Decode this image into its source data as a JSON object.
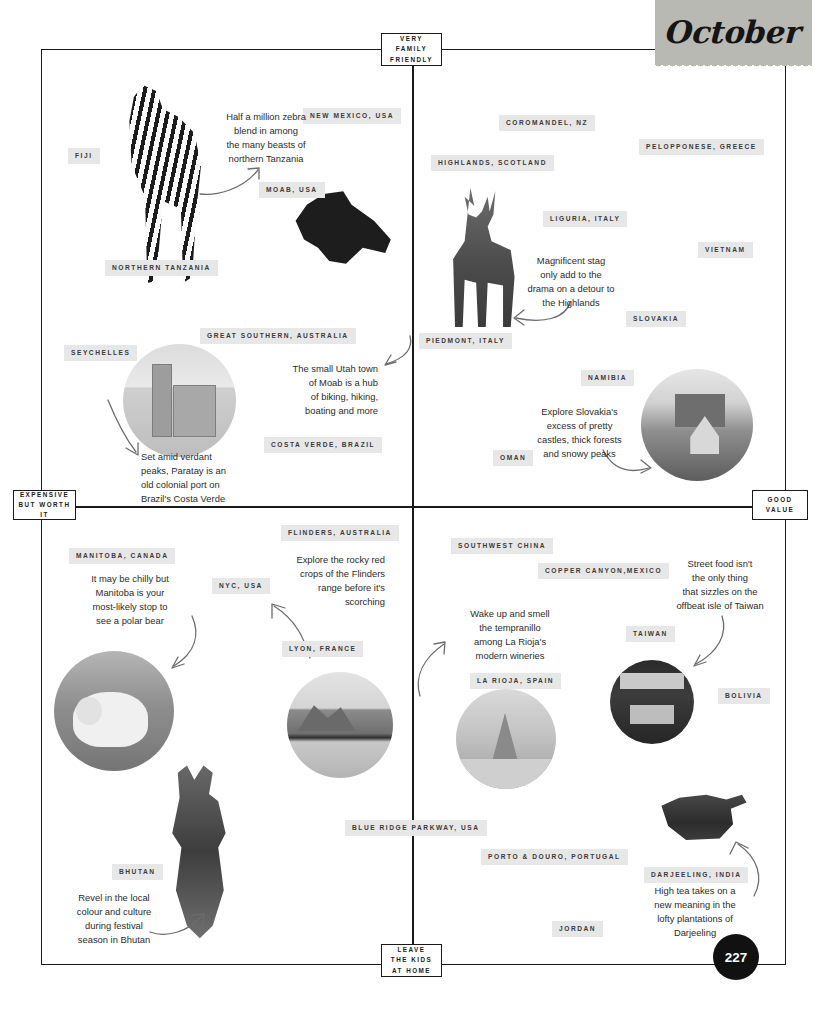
{
  "page": {
    "month": "October",
    "page_number": "227",
    "background_color": "#ffffff",
    "pill_color": "#e7e7e7",
    "tag_color": "#b9b9b4",
    "ink_color": "#1a1a1a"
  },
  "axes": {
    "top": "VERY\nFAMILY\nFRIENDLY",
    "bottom": "LEAVE\nTHE KIDS\nAT HOME",
    "left": "EXPENSIVE\nBUT WORTH IT",
    "right": "GOOD\nVALUE",
    "top_lines": [
      "VERY",
      "FAMILY",
      "FRIENDLY"
    ],
    "bottom_lines": [
      "LEAVE",
      "THE KIDS",
      "AT HOME"
    ],
    "left_lines": [
      "EXPENSIVE",
      "BUT WORTH IT"
    ],
    "right_lines": [
      "GOOD",
      "VALUE"
    ]
  },
  "destinations": [
    {
      "label": "FIJI",
      "quadrant": "top-left"
    },
    {
      "label": "NEW MEXICO, USA",
      "quadrant": "top-left"
    },
    {
      "label": "MOAB, USA",
      "quadrant": "top-left"
    },
    {
      "label": "NORTHERN TANZANIA",
      "quadrant": "top-left"
    },
    {
      "label": "GREAT SOUTHERN, AUSTRALIA",
      "quadrant": "top-left"
    },
    {
      "label": "SEYCHELLES",
      "quadrant": "top-left"
    },
    {
      "label": "COSTA VERDE, BRAZIL",
      "quadrant": "top-left"
    },
    {
      "label": "COROMANDEL, NZ",
      "quadrant": "top-right"
    },
    {
      "label": "PELOPPONESE, GREECE",
      "quadrant": "top-right"
    },
    {
      "label": "HIGHLANDS, SCOTLAND",
      "quadrant": "top-right"
    },
    {
      "label": "LIGURIA, ITALY",
      "quadrant": "top-right"
    },
    {
      "label": "VIETNAM",
      "quadrant": "top-right"
    },
    {
      "label": "SLOVAKIA",
      "quadrant": "top-right"
    },
    {
      "label": "PIEDMONT, ITALY",
      "quadrant": "top-right"
    },
    {
      "label": "NAMIBIA",
      "quadrant": "top-right"
    },
    {
      "label": "OMAN",
      "quadrant": "top-right"
    },
    {
      "label": "MANITOBA, CANADA",
      "quadrant": "bottom-left"
    },
    {
      "label": "FLINDERS, AUSTRALIA",
      "quadrant": "bottom-left"
    },
    {
      "label": "NYC, USA",
      "quadrant": "bottom-left"
    },
    {
      "label": "LYON, FRANCE",
      "quadrant": "bottom-left"
    },
    {
      "label": "BHUTAN",
      "quadrant": "bottom-left"
    },
    {
      "label": "BLUE RIDGE PARKWAY, USA",
      "quadrant": "bottom-left"
    },
    {
      "label": "SOUTHWEST CHINA",
      "quadrant": "bottom-right"
    },
    {
      "label": "COPPER CANYON,MEXICO",
      "quadrant": "bottom-right"
    },
    {
      "label": "TAIWAN",
      "quadrant": "bottom-right"
    },
    {
      "label": "BOLIVIA",
      "quadrant": "bottom-right"
    },
    {
      "label": "LA RIOJA, SPAIN",
      "quadrant": "bottom-right"
    },
    {
      "label": "PORTO & DOURO, PORTUGAL",
      "quadrant": "bottom-right"
    },
    {
      "label": "DARJEELING, INDIA",
      "quadrant": "bottom-right"
    },
    {
      "label": "JORDAN",
      "quadrant": "bottom-right"
    }
  ],
  "captions": [
    {
      "name": "zebra",
      "text": "Half a million zebra\nblend in among\nthe many beasts of\nnorthern Tanzania"
    },
    {
      "name": "stag",
      "text": "Magnificent stag\nonly add to the\ndrama on a detour to\nthe Highlands"
    },
    {
      "name": "moab",
      "text": "The small Utah town\nof Moab is a hub\nof biking, hiking,\nboating and more"
    },
    {
      "name": "paraty",
      "text": "Set amid verdant\npeaks, Paratay is an\nold colonial port on\nBrazil's Costa Verde"
    },
    {
      "name": "slovakia",
      "text": "Explore Slovakia's\nexcess of pretty\ncastles, thick forests\nand snowy peaks"
    },
    {
      "name": "manitoba",
      "text": "It may be chilly but\nManitoba is your\nmost-likely stop to\nsee a polar bear"
    },
    {
      "name": "flinders",
      "text": "Explore the rocky red\ncrops of the Flinders\nrange before it's\nscorching"
    },
    {
      "name": "larioja",
      "text": "Wake up and smell\nthe tempranillo\namong La Rioja's\nmodern wineries"
    },
    {
      "name": "taiwan",
      "text": "Street food isn't\nthe only thing\nthat sizzles on the\noffbeat isle of Taiwan"
    },
    {
      "name": "bhutan",
      "text": "Revel in the local\ncolour and culture\nduring festival\nseason in Bhutan"
    },
    {
      "name": "darjeeling",
      "text": "High tea takes on a\nnew meaning in the\nlofty plantations of\nDarjeeling"
    }
  ],
  "photos": [
    {
      "name": "zebra-photo",
      "subject": "zebra"
    },
    {
      "name": "cyclist-photo",
      "subject": "mountain biker"
    },
    {
      "name": "stag-photo",
      "subject": "red deer stag"
    },
    {
      "name": "church-photo",
      "subject": "colonial church, Paraty"
    },
    {
      "name": "castle-photo",
      "subject": "snowy Slovak castle"
    },
    {
      "name": "polar-bear-photo",
      "subject": "polar bear"
    },
    {
      "name": "mountain-photo",
      "subject": "Lyon mountain landscape"
    },
    {
      "name": "vineyard-photo",
      "subject": "La Rioja vineyard road"
    },
    {
      "name": "market-photo",
      "subject": "Taiwan night market"
    },
    {
      "name": "temple-photo",
      "subject": "Taiwan hillside temple"
    },
    {
      "name": "dancer-photo",
      "subject": "Bhutanese festival dancer"
    },
    {
      "name": "teapot-photo",
      "subject": "Darjeeling teapot with leaves"
    }
  ]
}
